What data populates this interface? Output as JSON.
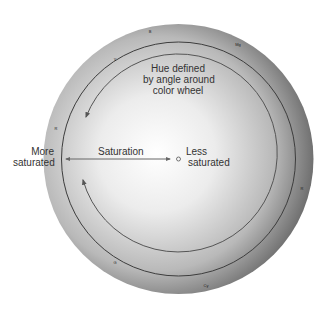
{
  "diagram": {
    "hue_label": [
      "Hue defined",
      "by angle around",
      "color wheel"
    ],
    "saturation_label": "Saturation",
    "more_saturated": [
      "More",
      "saturated"
    ],
    "less_saturated": [
      "Less",
      "saturated"
    ],
    "rim_labels": [
      {
        "text": "B",
        "x": 150,
        "y": 31
      },
      {
        "text": "Mg",
        "x": 238,
        "y": 44
      },
      {
        "text": "Y",
        "x": 115,
        "y": 59
      },
      {
        "text": "R",
        "x": 56,
        "y": 128
      },
      {
        "text": "R",
        "x": 302,
        "y": 188
      },
      {
        "text": "G",
        "x": 115,
        "y": 262
      },
      {
        "text": "Cy",
        "x": 206,
        "y": 285
      }
    ],
    "colors": {
      "disk_center": "#ffffff",
      "disk_edge": "#6a6a6a",
      "ring_line": "#3d3d3d",
      "arrow": "#555555",
      "text": "#333333"
    }
  }
}
